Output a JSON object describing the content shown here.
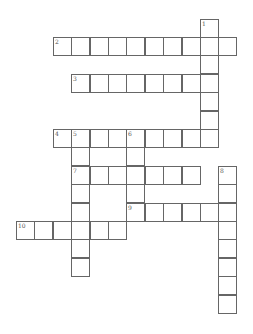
{
  "puzzle": {
    "type": "crossword",
    "cell_size": 18.4,
    "origin_x": 16,
    "origin_y": 18.5,
    "cells": [
      {
        "c": 10,
        "r": 0,
        "n": "1"
      },
      {
        "c": 10,
        "r": 1
      },
      {
        "c": 10,
        "r": 2
      },
      {
        "c": 10,
        "r": 3
      },
      {
        "c": 10,
        "r": 4
      },
      {
        "c": 10,
        "r": 5
      },
      {
        "c": 10,
        "r": 6
      },
      {
        "c": 2,
        "r": 1,
        "n": "2"
      },
      {
        "c": 3,
        "r": 1
      },
      {
        "c": 4,
        "r": 1
      },
      {
        "c": 5,
        "r": 1
      },
      {
        "c": 6,
        "r": 1
      },
      {
        "c": 7,
        "r": 1
      },
      {
        "c": 8,
        "r": 1
      },
      {
        "c": 9,
        "r": 1
      },
      {
        "c": 11,
        "r": 1
      },
      {
        "c": 3,
        "r": 3,
        "n": "3"
      },
      {
        "c": 4,
        "r": 3
      },
      {
        "c": 5,
        "r": 3
      },
      {
        "c": 6,
        "r": 3
      },
      {
        "c": 7,
        "r": 3
      },
      {
        "c": 8,
        "r": 3
      },
      {
        "c": 9,
        "r": 3
      },
      {
        "c": 2,
        "r": 6,
        "n": "4"
      },
      {
        "c": 3,
        "r": 6,
        "n": "5"
      },
      {
        "c": 4,
        "r": 6
      },
      {
        "c": 5,
        "r": 6
      },
      {
        "c": 6,
        "r": 6,
        "n": "6"
      },
      {
        "c": 7,
        "r": 6
      },
      {
        "c": 8,
        "r": 6
      },
      {
        "c": 9,
        "r": 6
      },
      {
        "c": 3,
        "r": 7
      },
      {
        "c": 6,
        "r": 7
      },
      {
        "c": 3,
        "r": 8,
        "n": "7"
      },
      {
        "c": 4,
        "r": 8
      },
      {
        "c": 5,
        "r": 8
      },
      {
        "c": 6,
        "r": 8
      },
      {
        "c": 7,
        "r": 8
      },
      {
        "c": 8,
        "r": 8
      },
      {
        "c": 9,
        "r": 8
      },
      {
        "c": 11,
        "r": 8,
        "n": "8"
      },
      {
        "c": 3,
        "r": 9
      },
      {
        "c": 6,
        "r": 9
      },
      {
        "c": 11,
        "r": 9
      },
      {
        "c": 3,
        "r": 10
      },
      {
        "c": 6,
        "r": 10,
        "n": "9"
      },
      {
        "c": 7,
        "r": 10
      },
      {
        "c": 8,
        "r": 10
      },
      {
        "c": 9,
        "r": 10
      },
      {
        "c": 10,
        "r": 10
      },
      {
        "c": 11,
        "r": 10
      },
      {
        "c": 0,
        "r": 11,
        "n": "10"
      },
      {
        "c": 1,
        "r": 11
      },
      {
        "c": 2,
        "r": 11
      },
      {
        "c": 3,
        "r": 11
      },
      {
        "c": 4,
        "r": 11
      },
      {
        "c": 5,
        "r": 11
      },
      {
        "c": 11,
        "r": 11
      },
      {
        "c": 3,
        "r": 12
      },
      {
        "c": 11,
        "r": 12
      },
      {
        "c": 3,
        "r": 13
      },
      {
        "c": 11,
        "r": 13
      },
      {
        "c": 11,
        "r": 14
      },
      {
        "c": 11,
        "r": 15
      }
    ]
  }
}
